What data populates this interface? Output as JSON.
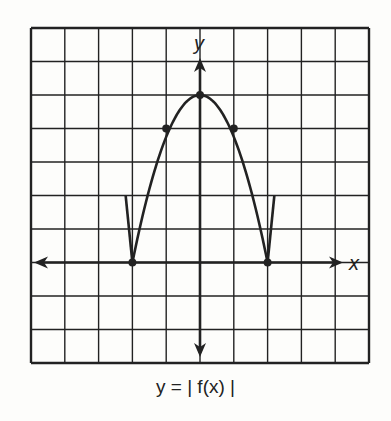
{
  "figure": {
    "caption": "y = | f(x) |",
    "x_axis_label": "x",
    "y_axis_label": "y",
    "grid": {
      "columns": 10,
      "rows": 10,
      "x_range": [
        -5,
        5
      ],
      "y_range": [
        -3,
        7
      ]
    },
    "colors": {
      "line": "#222222",
      "background": "#fdfdfb"
    }
  },
  "chart_data": {
    "type": "line",
    "title": "y = | f(x) |",
    "xlabel": "x",
    "ylabel": "y",
    "xlim": [
      -5,
      5
    ],
    "ylim": [
      -3,
      7
    ],
    "grid": true,
    "marked_points": [
      [
        -2,
        0
      ],
      [
        -1,
        4
      ],
      [
        0,
        5
      ],
      [
        1,
        4
      ],
      [
        2,
        0
      ]
    ],
    "series": [
      {
        "name": "parabola segment",
        "points": [
          [
            -2,
            0
          ],
          [
            -1,
            4
          ],
          [
            0,
            5
          ],
          [
            1,
            4
          ],
          [
            2,
            0
          ]
        ]
      },
      {
        "name": "left branch",
        "points": [
          [
            -2.2,
            2
          ],
          [
            -2,
            0
          ]
        ]
      },
      {
        "name": "right branch",
        "points": [
          [
            2.2,
            2
          ],
          [
            2,
            0
          ]
        ]
      }
    ]
  }
}
